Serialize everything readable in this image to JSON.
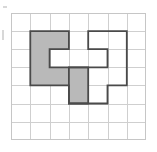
{
  "figure": {
    "colors": {
      "background": "#ffffff",
      "grid_line": "#cfcfcf",
      "grid_border": "#c6c6c6",
      "shape_outline": "#4a4a4a",
      "shaded_fill": "#b9b9b9",
      "open_fill": "none"
    },
    "grid": {
      "columns": 7,
      "rows": 7,
      "cell_width": 19.3,
      "cell_height": 18.1,
      "origin_x": 0,
      "origin_y": 0
    },
    "shapes": [
      {
        "name": "shaded-shape",
        "label": "shaded polyomino",
        "filled": true,
        "cells": [
          {
            "col": 1,
            "row": 1
          },
          {
            "col": 2,
            "row": 1
          },
          {
            "col": 1,
            "row": 2
          },
          {
            "col": 1,
            "row": 3
          },
          {
            "col": 2,
            "row": 3
          },
          {
            "col": 3,
            "row": 3
          },
          {
            "col": 3,
            "row": 4
          }
        ],
        "cell_count": 7,
        "outline_points": "1,1 3,1 3,2 2,2 2,3 4,3 4,5 3,5 3,4 1,4"
      },
      {
        "name": "open-shape",
        "label": "unshaded polyomino",
        "filled": false,
        "cells": [
          {
            "col": 4,
            "row": 1
          },
          {
            "col": 5,
            "row": 1
          },
          {
            "col": 5,
            "row": 2
          },
          {
            "col": 4,
            "row": 3
          },
          {
            "col": 5,
            "row": 3
          },
          {
            "col": 4,
            "row": 4
          }
        ],
        "cell_count": 6,
        "outline_points": "4,1 6,1 6,4 5,4 5,5 3,5 3,3 5,3 5,2 4,2"
      }
    ],
    "grid_vertical_lines": [
      0,
      1,
      2,
      3,
      4,
      5,
      6,
      7
    ],
    "grid_horizontal_lines": [
      0,
      1,
      2,
      3,
      4,
      5,
      6,
      7
    ]
  }
}
